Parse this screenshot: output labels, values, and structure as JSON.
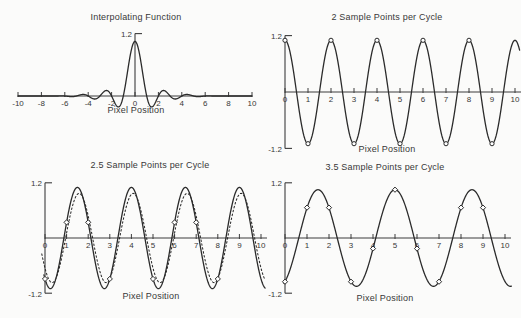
{
  "figure": {
    "background": "#fbfbfa",
    "line_color": "#2b2b2b",
    "axis_color": "#3c3c3c",
    "text_color": "#383838"
  },
  "chart_data": [
    {
      "type": "line",
      "title": "Interpolating Function",
      "xlabel": "Pixel Position",
      "xlim": [
        -10,
        10
      ],
      "xticks": [
        -10,
        -8,
        -6,
        -4,
        -2,
        0,
        2,
        4,
        6,
        8,
        10
      ],
      "ylim": [
        0,
        1.2
      ],
      "ylabels": [
        {
          "value": 1.2,
          "label": "1.2"
        }
      ],
      "grid": false,
      "curves": [
        {
          "kind": "windowed_sinc",
          "style": "solid",
          "role": "sinc-interpolation-kernel",
          "amplitude": 1.05,
          "lobe_radius": 6.6,
          "zero_crossing_spacing": 1,
          "domain": [
            -10,
            10
          ]
        }
      ]
    },
    {
      "type": "line",
      "title": "2 Sample Points per Cycle",
      "xlabel": "Pixel Position",
      "xlim": [
        0,
        10
      ],
      "xticks": [
        0,
        1,
        2,
        3,
        4,
        5,
        6,
        7,
        8,
        9,
        10
      ],
      "ylim": [
        -1.2,
        1.2
      ],
      "ylabels": [
        {
          "value": 1.2,
          "label": "1.2"
        },
        {
          "value": -1.2,
          "label": "-1.2"
        }
      ],
      "grid": false,
      "curves": [
        {
          "kind": "cosine",
          "style": "solid",
          "role": "original-signal",
          "amplitude": 1.1,
          "period": 2,
          "peak_x": 0,
          "domain": [
            0,
            10.2
          ]
        }
      ],
      "samples": {
        "marker": "circle",
        "points": [
          [
            0,
            1.1
          ],
          [
            1,
            -1.1
          ],
          [
            2,
            1.1
          ],
          [
            3,
            -1.1
          ],
          [
            4,
            1.1
          ],
          [
            5,
            -1.1
          ],
          [
            6,
            1.1
          ],
          [
            7,
            -1.1
          ],
          [
            8,
            1.1
          ],
          [
            9,
            -1.1
          ]
        ]
      }
    },
    {
      "type": "line",
      "title": "2.5 Sample Points per Cycle",
      "xlabel": "Pixel Position",
      "xlim": [
        0,
        10
      ],
      "xticks": [
        0,
        1,
        2,
        3,
        4,
        5,
        6,
        7,
        8,
        9,
        10
      ],
      "ylim": [
        -1.2,
        1.2
      ],
      "ylabels": [
        {
          "value": 1.2,
          "label": "1.2"
        },
        {
          "value": -1.2,
          "label": "-1.2"
        }
      ],
      "grid": false,
      "curves": [
        {
          "kind": "cosine",
          "style": "solid",
          "role": "original-signal",
          "amplitude": 1.1,
          "period": 2.5,
          "peak_x": 1.5,
          "domain": [
            -0.05,
            10.2
          ]
        },
        {
          "kind": "cosine",
          "style": "dotted",
          "role": "reconstructed-signal",
          "amplitude": 0.97,
          "period": 2.5,
          "peak_x": 1.58,
          "domain": [
            -0.15,
            10.2
          ]
        }
      ],
      "samples": {
        "marker": "diamond",
        "points": [
          [
            0,
            -0.89
          ],
          [
            1,
            0.34
          ],
          [
            2,
            0.34
          ],
          [
            3,
            -0.89
          ],
          [
            5,
            -0.89
          ],
          [
            6,
            0.34
          ],
          [
            7,
            0.34
          ],
          [
            8,
            -0.89
          ]
        ]
      }
    },
    {
      "type": "line",
      "title": "3.5 Sample Points per Cycle",
      "xlabel": "Pixel Position",
      "xlim": [
        0,
        10
      ],
      "xticks": [
        0,
        1,
        2,
        3,
        4,
        5,
        6,
        7,
        8,
        9,
        10
      ],
      "ylim": [
        -1.2,
        1.2
      ],
      "ylabels": [
        {
          "value": 1.2,
          "label": "1.2"
        },
        {
          "value": -1.2,
          "label": "-1.2"
        }
      ],
      "grid": false,
      "curves": [
        {
          "kind": "cosine",
          "style": "solid",
          "role": "original-signal",
          "amplitude": 1.05,
          "period": 3.5,
          "peak_x": 1.5,
          "domain": [
            -0.05,
            10.3
          ]
        }
      ],
      "samples": {
        "marker": "diamond",
        "points": [
          [
            0,
            -0.95
          ],
          [
            1,
            0.66
          ],
          [
            2,
            0.66
          ],
          [
            3,
            -0.95
          ],
          [
            4,
            -0.23
          ],
          [
            5,
            1.05
          ],
          [
            6,
            -0.23
          ],
          [
            7,
            -0.95
          ],
          [
            8,
            0.66
          ],
          [
            9,
            0.66
          ]
        ]
      }
    }
  ]
}
